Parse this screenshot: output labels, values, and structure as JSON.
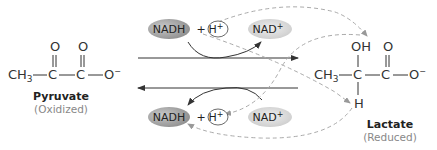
{
  "pyruvate": {
    "name": "Pyruvate",
    "state": "(Oxidized)",
    "atoms": {
      "ch3": "CH3",
      "c1": "C",
      "c2": "C",
      "o_minus": "O−",
      "o1": "O",
      "o2": "O"
    }
  },
  "lactate": {
    "name": "Lactate",
    "state": "(Reduced)",
    "atoms": {
      "ch3": "CH3",
      "c1": "C",
      "c2": "C",
      "o_minus": "O−",
      "oh": "OH",
      "o2": "O",
      "h": "H"
    }
  },
  "top_reaction": {
    "nadh": "NADH",
    "plus": "+",
    "h_plus": "H+",
    "nad_plus": "NAD+"
  },
  "bottom_reaction": {
    "nadh": "NADH",
    "plus": "+",
    "h_plus": "H+",
    "nad_plus": "NAD+"
  },
  "colors": {
    "pill_dark": "#9a9a9a",
    "pill_light": "#d4d4d4",
    "dashed_arrow": "#aaaaaa",
    "solid_arrow": "#333333"
  }
}
